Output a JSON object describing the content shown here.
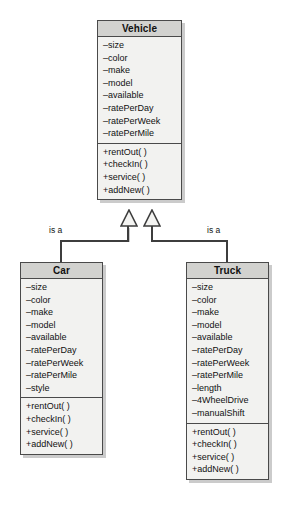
{
  "diagram": {
    "type": "uml-class-diagram",
    "background_color": "#ffffff",
    "line_color": "#3d3d3d",
    "box_fill": "#f2f2f0",
    "header_fill": "#d2d2cf",
    "border_color": "#4a4a4a"
  },
  "classes": {
    "vehicle": {
      "name": "Vehicle",
      "attributes": [
        "–size",
        "–color",
        "–make",
        "–model",
        "–available",
        "–ratePerDay",
        "–ratePerWeek",
        "–ratePerMile"
      ],
      "methods": [
        "+rentOut( )",
        "+checkIn( )",
        "+service( )",
        "+addNew( )"
      ]
    },
    "car": {
      "name": "Car",
      "attributes": [
        "–size",
        "–color",
        "–make",
        "–model",
        "–available",
        "–ratePerDay",
        "–ratePerWeek",
        "–ratePerMile",
        "–style"
      ],
      "methods": [
        "+rentOut( )",
        "+checkIn( )",
        "+service( )",
        "+addNew( )"
      ]
    },
    "truck": {
      "name": "Truck",
      "attributes": [
        "–size",
        "–color",
        "–make",
        "–model",
        "–available",
        "–ratePerDay",
        "–ratePerWeek",
        "–ratePerMile",
        "–length",
        "–4WheelDrive",
        "–manualShift"
      ],
      "methods": [
        "+rentOut( )",
        "+checkIn( )",
        "+service( )",
        "+addNew( )"
      ]
    }
  },
  "relationships": {
    "car_to_vehicle": {
      "label": "is a",
      "kind": "generalization"
    },
    "truck_to_vehicle": {
      "label": "is a",
      "kind": "generalization"
    }
  }
}
